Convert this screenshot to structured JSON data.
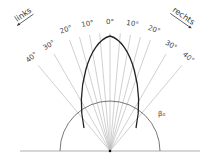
{
  "diagram": {
    "angle_labels": [
      {
        "text": "40°",
        "angle": -40
      },
      {
        "text": "30°",
        "angle": -30
      },
      {
        "text": "20°",
        "angle": -20
      },
      {
        "text": "10°",
        "angle": -10
      },
      {
        "text": "0°",
        "angle": 0
      },
      {
        "text": "10°",
        "angle": 10
      },
      {
        "text": "20°",
        "angle": 20
      },
      {
        "text": "30°",
        "angle": 30
      },
      {
        "text": "40°",
        "angle": 40
      }
    ],
    "left_label": "links",
    "right_label": "rechts",
    "circle_label": "β₀",
    "ray_angles": [
      -40,
      -30,
      -20,
      -15,
      -10,
      -5,
      0,
      5,
      10,
      15,
      20,
      30,
      40
    ],
    "colors": {
      "ray": "#bbbbbb",
      "curve": "#222222",
      "circle": "#555555",
      "baseline": "#999999"
    }
  }
}
